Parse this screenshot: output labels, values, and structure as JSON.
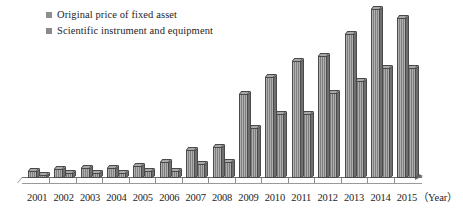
{
  "chart_data": {
    "type": "bar",
    "title": "",
    "subtitle": "",
    "xlabel": "（Year）",
    "ylabel": "",
    "grid": false,
    "legend_position": "top-left",
    "categories": [
      "2001",
      "2002",
      "2003",
      "2004",
      "2005",
      "2006",
      "2007",
      "2008",
      "2009",
      "2010",
      "2011",
      "2012",
      "2013",
      "2014",
      "2015"
    ],
    "ylim": [
      0,
      100
    ],
    "series": [
      {
        "name": "Original price of fixed asset",
        "color": "#8e8e8e",
        "values": [
          4,
          5,
          6,
          6,
          7,
          9,
          16,
          18,
          48,
          58,
          67,
          70,
          83,
          97,
          92
        ]
      },
      {
        "name": "Scientific instrument and equipment",
        "color": "#8a8a8a",
        "values": [
          2,
          3,
          3,
          3,
          4,
          4,
          8,
          9,
          29,
          37,
          37,
          49,
          56,
          63,
          63
        ]
      }
    ],
    "annotations": []
  },
  "legend": {
    "items": [
      {
        "label": "Original price of fixed asset",
        "swatch": "legend-swatch-series-1"
      },
      {
        "label": "Scientific instrument and equipment",
        "swatch": "legend-swatch-series-2"
      }
    ]
  },
  "axis": {
    "unit_label": "（Year）"
  }
}
